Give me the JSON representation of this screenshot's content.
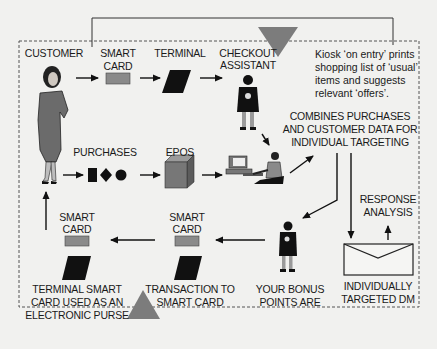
{
  "diagram": {
    "colors": {
      "background": "#f1f1ef",
      "ink": "#111111",
      "card_grey": "#8a8a8a",
      "triangle_grey": "#7c7c7c",
      "frame": "#555555"
    },
    "nodes": {
      "customer": "CUSTOMER",
      "smart_card_top_1": "SMART",
      "smart_card_top_2": "CARD",
      "terminal": "TERMINAL",
      "checkout_1": "CHECKOUT",
      "checkout_2": "ASSISTANT",
      "purchases": "PURCHASES",
      "epos": "EPOS",
      "combines_1": "COMBINES PURCHASES",
      "combines_2": "AND CUSTOMER DATA FOR",
      "combines_3": "INDIVIDUAL TARGETING",
      "response_1": "RESPONSE",
      "response_2": "ANALYSIS",
      "smart_card_left_1": "SMART",
      "smart_card_left_2": "CARD",
      "smart_card_mid_1": "SMART",
      "smart_card_mid_2": "CARD",
      "terminal_purse_1": "TERMINAL SMART",
      "terminal_purse_2": "CARD USED AS AN",
      "terminal_purse_3": "ELECTRONIC PURSE",
      "transaction_1": "TRANSACTION TO",
      "transaction_2": "SMART CARD",
      "bonus_1": "YOUR BONUS",
      "bonus_2": "POINTS ARE",
      "dm_1": "INDIVIDUALLY",
      "dm_2": "TARGETED DM"
    },
    "kiosk_note": "Kiosk ‘on entry’ prints\nshopping list of ‘usual’\nitems and suggests\nrelevant ‘offers’."
  }
}
